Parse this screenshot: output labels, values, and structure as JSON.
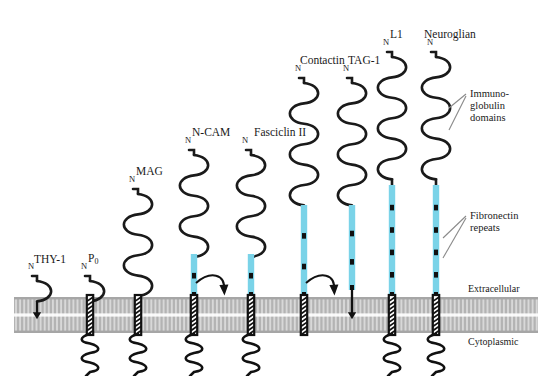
{
  "figure": {
    "title_visible": false,
    "type": "biological-diagram",
    "colors": {
      "ig_domain_stroke": "#1a1a1a",
      "fibronectin_fill": "#7ad3e8",
      "fibronectin_band": "#111111",
      "membrane_gray": "#b3b3b3",
      "membrane_line": "#d8d8d8",
      "text": "#1a1a1a",
      "leader_line": "#8a8a8a",
      "background": "#ffffff"
    }
  },
  "membrane": {
    "extracellular_label": "Extracellular",
    "cytoplasmic_label": "Cytoplasmic",
    "top_y": 297,
    "bottom_y": 333
  },
  "annotations": [
    {
      "id": "immunoglobulin-domains",
      "line1": "Immuno-",
      "line2": "globulin",
      "line3": "domains",
      "x": 470,
      "y": 88
    },
    {
      "id": "fibronectin-repeats",
      "line1": "Fibronectin",
      "line2": "repeats",
      "x": 470,
      "y": 210
    }
  ],
  "molecules": [
    {
      "id": "thy-1",
      "name": "THY-1",
      "name_sub": "",
      "name_x": 34,
      "name_y": 253,
      "axis_x": 37,
      "n_label": "N",
      "c_label": "",
      "ig_count": 1,
      "ig_top_y": 281,
      "fn_count": 0,
      "fn_top_y": 0,
      "fn_bottom_y": 0,
      "anchor": "gpi-straight",
      "has_tm_helix": false,
      "has_cyto_coil": false
    },
    {
      "id": "p0",
      "name": "P",
      "name_sub": "0",
      "name_x": 88,
      "name_y": 252,
      "axis_x": 90,
      "n_label": "N",
      "c_label": "C",
      "ig_count": 1,
      "ig_top_y": 281,
      "fn_count": 0,
      "fn_top_y": 0,
      "fn_bottom_y": 0,
      "anchor": "transmembrane",
      "has_tm_helix": true,
      "has_cyto_coil": true
    },
    {
      "id": "mag",
      "name": "MAG",
      "name_sub": "",
      "name_x": 136,
      "name_y": 165,
      "axis_x": 138,
      "n_label": "N",
      "c_label": "C",
      "ig_count": 5,
      "ig_top_y": 194,
      "fn_count": 0,
      "fn_top_y": 0,
      "fn_bottom_y": 0,
      "anchor": "transmembrane",
      "has_tm_helix": true,
      "has_cyto_coil": true
    },
    {
      "id": "n-cam",
      "name": "N-CAM",
      "name_sub": "",
      "name_x": 192,
      "name_y": 126,
      "axis_x": 194,
      "n_label": "N",
      "c_label": "C",
      "ig_count": 5,
      "ig_top_y": 155,
      "fn_count": 2,
      "fn_top_y": 254,
      "fn_bottom_y": 297,
      "anchor": "transmembrane-plus-gpi-curved",
      "has_tm_helix": true,
      "has_cyto_coil": true
    },
    {
      "id": "fasciclin-ii",
      "name": "Fasciclin II",
      "name_sub": "",
      "name_x": 254,
      "name_y": 126,
      "axis_x": 251,
      "n_label": "N",
      "c_label": "C",
      "ig_count": 5,
      "ig_top_y": 155,
      "fn_count": 2,
      "fn_top_y": 254,
      "fn_bottom_y": 297,
      "anchor": "transmembrane",
      "has_tm_helix": true,
      "has_cyto_coil": true
    },
    {
      "id": "contactin",
      "name": "Contactin",
      "name_sub": "",
      "name_x": 300,
      "name_y": 54,
      "axis_x": 304,
      "n_label": "N",
      "c_label": "",
      "ig_count": 6,
      "ig_top_y": 83,
      "fn_count": 3,
      "fn_top_y": 205,
      "fn_bottom_y": 297,
      "anchor": "gpi-curved",
      "has_tm_helix": true,
      "has_cyto_coil": false
    },
    {
      "id": "tag-1",
      "name": "TAG-1",
      "name_sub": "",
      "name_x": 348,
      "name_y": 54,
      "axis_x": 352,
      "n_label": "N",
      "c_label": "",
      "ig_count": 6,
      "ig_top_y": 83,
      "fn_count": 3,
      "fn_top_y": 205,
      "fn_bottom_y": 290,
      "anchor": "gpi-straight",
      "has_tm_helix": false,
      "has_cyto_coil": false
    },
    {
      "id": "l1",
      "name": "L1",
      "name_sub": "",
      "name_x": 390,
      "name_y": 28,
      "axis_x": 392,
      "n_label": "N",
      "c_label": "C",
      "ig_count": 6,
      "ig_top_y": 57,
      "fn_count": 5,
      "fn_top_y": 185,
      "fn_bottom_y": 297,
      "anchor": "transmembrane",
      "has_tm_helix": true,
      "has_cyto_coil": true
    },
    {
      "id": "neuroglian",
      "name": "Neuroglian",
      "name_sub": "",
      "name_x": 424,
      "name_y": 28,
      "axis_x": 436,
      "n_label": "N",
      "c_label": "C",
      "ig_count": 6,
      "ig_top_y": 57,
      "fn_count": 5,
      "fn_top_y": 185,
      "fn_bottom_y": 297,
      "anchor": "transmembrane",
      "has_tm_helix": true,
      "has_cyto_coil": true
    }
  ]
}
